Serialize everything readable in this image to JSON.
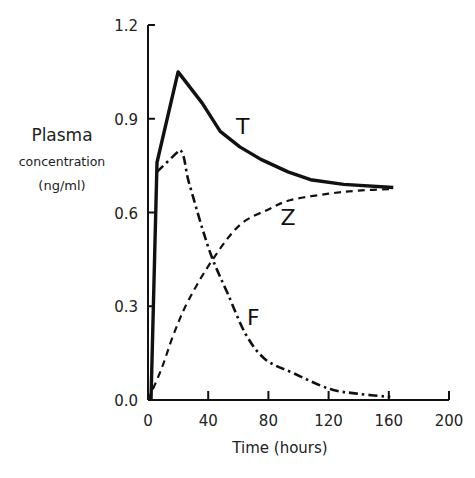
{
  "chart_data": {
    "type": "line",
    "title": "",
    "xlabel": "Time (hours)",
    "ylabel": [
      "Plasma",
      "concentration",
      "(ng/ml)"
    ],
    "xlim": [
      0,
      200
    ],
    "ylim": [
      0.0,
      1.2
    ],
    "x_ticks": [
      0,
      40,
      80,
      120,
      160,
      200
    ],
    "x_tick_labels": [
      "0",
      "40",
      "80",
      "120",
      "160",
      "200"
    ],
    "y_ticks": [
      0.0,
      0.3,
      0.6,
      0.9,
      1.2
    ],
    "y_tick_labels": [
      "0.0",
      "0.3",
      "0.6",
      "0.9",
      "1.2"
    ],
    "grid": false,
    "legend": "inline curve labels",
    "series": [
      {
        "name": "T",
        "style": "solid",
        "x": [
          2,
          6,
          20,
          36,
          48,
          61,
          75,
          93,
          108,
          130,
          163
        ],
        "y": [
          0.0,
          0.76,
          1.05,
          0.95,
          0.86,
          0.81,
          0.77,
          0.73,
          0.705,
          0.69,
          0.68
        ]
      },
      {
        "name": "F",
        "style": "dash-dot",
        "x": [
          6,
          21,
          27,
          36,
          43,
          53,
          65,
          78,
          97,
          121,
          140,
          161
        ],
        "y": [
          0.73,
          0.8,
          0.7,
          0.55,
          0.45,
          0.34,
          0.21,
          0.13,
          0.085,
          0.035,
          0.02,
          0.01
        ],
        "start_note": "branches off T near (6, 0.73)"
      },
      {
        "name": "Z",
        "style": "dashed",
        "x": [
          0,
          9,
          17,
          27,
          43,
          61,
          80,
          95,
          120,
          140,
          163
        ],
        "y": [
          0.0,
          0.1,
          0.21,
          0.32,
          0.45,
          0.56,
          0.61,
          0.64,
          0.66,
          0.67,
          0.675
        ]
      }
    ],
    "annotations": [
      {
        "text": "T",
        "x": 63,
        "y": 0.85
      },
      {
        "text": "Z",
        "x": 93,
        "y": 0.56
      },
      {
        "text": "F",
        "x": 70,
        "y": 0.24
      }
    ]
  }
}
